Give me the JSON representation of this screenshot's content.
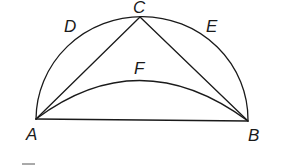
{
  "diagram": {
    "type": "geometry",
    "points": {
      "A": {
        "label": "A",
        "x": 36,
        "y": 119
      },
      "B": {
        "label": "B",
        "x": 248,
        "y": 120
      },
      "C": {
        "label": "C",
        "x": 140,
        "y": 17
      }
    },
    "arc_labels": {
      "D": "D",
      "E": "E",
      "F": "F"
    },
    "segments": [
      "AB",
      "AC",
      "CB"
    ],
    "arcs": [
      "ADC",
      "CEB",
      "AFB"
    ],
    "colors": {
      "line": "#1a1a1a",
      "background": "#ffffff"
    }
  }
}
